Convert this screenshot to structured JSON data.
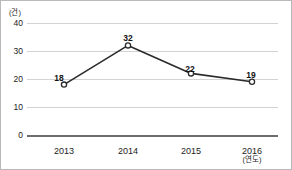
{
  "chart_data": {
    "type": "line",
    "title": "",
    "subtitle": "",
    "xlabel": "(연도)",
    "ylabel": "(건)",
    "categories": [
      "2013",
      "2014",
      "2015",
      "2016"
    ],
    "values": [
      18,
      32,
      22,
      19
    ],
    "series": [
      {
        "name": "건수",
        "values": [
          18,
          32,
          22,
          19
        ]
      }
    ],
    "point_labels": [
      "18",
      "32",
      "22",
      "19"
    ],
    "ylim": [
      0,
      40
    ],
    "yticks": [
      0,
      10,
      20,
      30,
      40
    ],
    "ytick_labels": [
      "0",
      "10",
      "20",
      "30",
      "40"
    ],
    "xtick_labels": [
      "2013",
      "2014",
      "2015",
      "2016"
    ],
    "grid": true,
    "legend": false,
    "legend_position": "none",
    "marker": "open-circle",
    "colors": {
      "line": "#2b2b2b",
      "marker_face": "#ffffff",
      "marker_edge": "#2b2b2b",
      "gridline": "#d3d3d3",
      "axis_baseline": "#6d6d6d",
      "text": "#1c1c1c",
      "border": "#b9b9b9",
      "background": "#ffffff"
    }
  },
  "axes": {
    "y_unit_label": "(건)",
    "x_unit_label": "(연도)",
    "y_ticks": [
      {
        "label": "40",
        "value": 40
      },
      {
        "label": "30",
        "value": 30
      },
      {
        "label": "20",
        "value": 20
      },
      {
        "label": "10",
        "value": 10
      },
      {
        "label": "0",
        "value": 0
      }
    ],
    "x_ticks": [
      {
        "label": "2013"
      },
      {
        "label": "2014"
      },
      {
        "label": "2015"
      },
      {
        "label": "2016"
      }
    ]
  },
  "points": [
    {
      "label": "18",
      "category": "2013"
    },
    {
      "label": "32",
      "category": "2014"
    },
    {
      "label": "22",
      "category": "2015"
    },
    {
      "label": "19",
      "category": "2016"
    }
  ]
}
